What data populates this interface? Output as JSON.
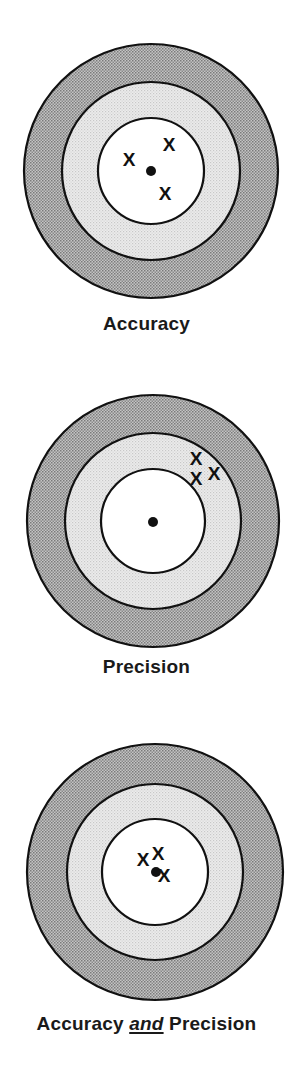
{
  "figure": {
    "colors": {
      "outer_ring": "#a8a8a8",
      "middle_ring": "#dedede",
      "inner": "#ffffff",
      "outline": "#111111",
      "marks": "#111111"
    },
    "marker_glyph": "X",
    "targets": [
      {
        "id": "accuracy",
        "label": "Accuracy",
        "center": [
          151,
          171
        ],
        "radii": {
          "outer": 127,
          "middle": 89,
          "inner": 53
        },
        "bullseye": [
          151,
          171
        ],
        "hits": [
          [
            129,
            159
          ],
          [
            169,
            144
          ],
          [
            165,
            193
          ]
        ]
      },
      {
        "id": "precision",
        "label": "Precision",
        "center": [
          153,
          521
        ],
        "radii": {
          "outer": 126,
          "middle": 88,
          "inner": 52
        },
        "bullseye": [
          153,
          522
        ],
        "hits": [
          [
            196,
            458
          ],
          [
            196,
            478
          ],
          [
            214,
            473
          ]
        ]
      },
      {
        "id": "accuracy-and-precision",
        "label_parts": [
          "Accuracy ",
          "and",
          " Precision"
        ],
        "center": [
          155,
          872
        ],
        "radii": {
          "outer": 128,
          "middle": 88,
          "inner": 53
        },
        "bullseye": [
          156,
          872
        ],
        "hits": [
          [
            143,
            859
          ],
          [
            158,
            853
          ],
          [
            164,
            875
          ]
        ]
      }
    ]
  }
}
